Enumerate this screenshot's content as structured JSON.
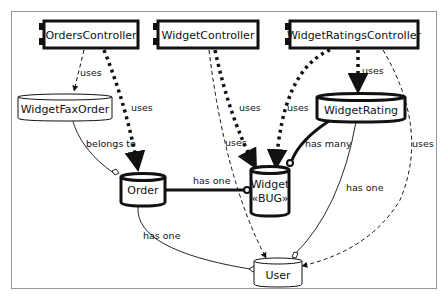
{
  "diagram": {
    "nodes": {
      "orders_controller": "OrdersController",
      "widget_controller": "WidgetController",
      "widget_ratings_controller": "WidgetRatingsController",
      "widget_fax_order": "WidgetFaxOrder",
      "widget_rating": "WidgetRating",
      "order": "Order",
      "widget": "Widget",
      "widget_stereotype": "«BUG»",
      "user": "User"
    },
    "edges": [
      {
        "from": "OrdersController",
        "to": "WidgetFaxOrder",
        "label": "uses",
        "style": "dashed-thin"
      },
      {
        "from": "OrdersController",
        "to": "Order",
        "label": "uses",
        "style": "dashed-thick"
      },
      {
        "from": "WidgetController",
        "to": "Widget",
        "label": "uses",
        "style": "dashed-thick"
      },
      {
        "from": "WidgetController",
        "to": "User",
        "label": "uses",
        "style": "dashed-thin"
      },
      {
        "from": "WidgetRatingsController",
        "to": "WidgetRating",
        "label": "uses",
        "style": "dashed-thick"
      },
      {
        "from": "WidgetRatingsController",
        "to": "Widget",
        "label": "uses",
        "style": "dashed-thick"
      },
      {
        "from": "WidgetRatingsController",
        "to": "User",
        "label": "uses",
        "style": "dashed-thin"
      },
      {
        "from": "WidgetFaxOrder",
        "to": "Order",
        "label": "belongs to",
        "style": "solid-thin"
      },
      {
        "from": "Order",
        "to": "Widget",
        "label": "has one",
        "style": "solid-thick"
      },
      {
        "from": "WidgetRating",
        "to": "Widget",
        "label": "has many",
        "style": "solid-thick"
      },
      {
        "from": "WidgetRating",
        "to": "User",
        "label": "has one",
        "style": "solid-thin"
      },
      {
        "from": "Order",
        "to": "User",
        "label": "has one",
        "style": "solid-thin"
      }
    ],
    "labels": {
      "uses": "uses",
      "belongs_to": "belongs to",
      "has_one": "has one",
      "has_many": "has many"
    }
  }
}
